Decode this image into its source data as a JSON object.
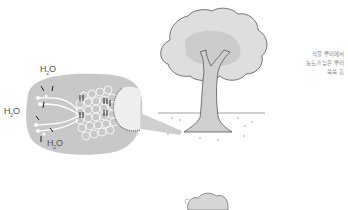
{
  "diagram": {
    "labels": {
      "h2o_top": "H",
      "h2o_left": "H",
      "h2o_bottom": "H",
      "h2o_sub": "2",
      "h2o_o": "O"
    },
    "note_lines": [
      "식물 뿌리에서",
      "농도가 높은 뿌리",
      "쑥쑥 흡"
    ],
    "colors": {
      "bubble": "#c9c9c9",
      "cells": "#ffffff",
      "tree_crown": "#dcdcdc",
      "outline": "#555555",
      "background": "#ffffff"
    }
  }
}
